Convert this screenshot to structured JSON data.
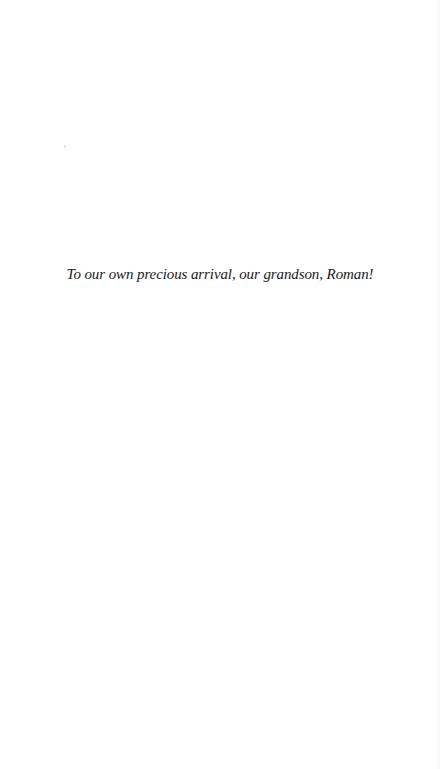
{
  "page": {
    "dedication": "To our own precious arrival, our grandson, Roman!"
  }
}
